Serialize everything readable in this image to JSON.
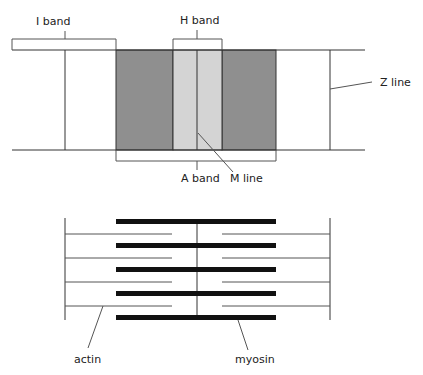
{
  "colors": {
    "background": "#ffffff",
    "line": "#333333",
    "a_band_dark": "#8f8f8f",
    "h_zone_light": "#d4d4d4",
    "myosin": "#111111",
    "actin": "#555555"
  },
  "top_diagram": {
    "labels": {
      "i_band": "I band",
      "h_band": "H band",
      "a_band": "A band",
      "m_line": "M line",
      "z_line": "Z line"
    }
  },
  "bottom_diagram": {
    "labels": {
      "actin": "actin",
      "myosin": "myosin"
    },
    "myosin_filament_count": 5,
    "actin_filament_rows": 4
  }
}
